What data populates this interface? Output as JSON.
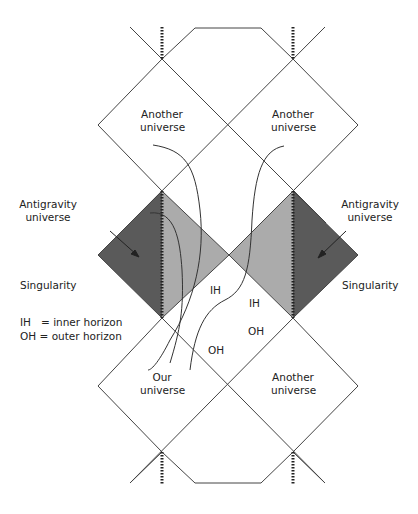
{
  "colors": {
    "line": "#444444",
    "dark_region": "#5a5a5a",
    "light_region": "#ababab",
    "background": "#ffffff"
  },
  "labels": {
    "another_universe_top_left": [
      "Another",
      "universe"
    ],
    "another_universe_top_right": [
      "Another",
      "universe"
    ],
    "antigravity_left": [
      "Antigravity",
      "universe"
    ],
    "antigravity_right": [
      "Antigravity",
      "universe"
    ],
    "singularity_left": "Singularity",
    "singularity_right": "Singularity",
    "ih_left": "IH",
    "ih_right": "IH",
    "oh_left": "OH",
    "oh_right": "OH",
    "our_universe": [
      "Our",
      "universe"
    ],
    "another_universe_bottom_right": [
      "Another",
      "universe"
    ]
  },
  "legend": {
    "ih": "IH   = inner horizon",
    "oh": "OH = outer horizon"
  }
}
